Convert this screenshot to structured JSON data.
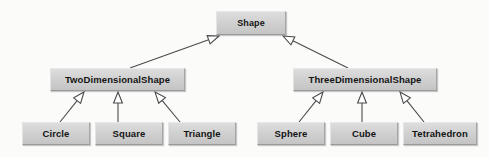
{
  "diagram": {
    "type": "uml-class-inheritance-hierarchy",
    "colors": {
      "background": "#fbfbfa",
      "node_fill": "#d2d2d2",
      "node_border_light": "#e9e9e9",
      "node_border_dark": "#9a9a9a",
      "text": "#141414",
      "edge": "#4a4a4a"
    },
    "nodes": [
      {
        "id": "shape",
        "label": "Shape",
        "tier": "root",
        "x": 216,
        "y": 11,
        "w": 70,
        "h": 24
      },
      {
        "id": "twod",
        "label": "TwoDimensionalShape",
        "tier": "mid",
        "x": 50,
        "y": 68,
        "w": 135,
        "h": 23
      },
      {
        "id": "threed",
        "label": "ThreeDimensionalShape",
        "tier": "mid",
        "x": 293,
        "y": 68,
        "w": 144,
        "h": 23
      },
      {
        "id": "circle",
        "label": "Circle",
        "tier": "leaf",
        "x": 22,
        "y": 122,
        "w": 68,
        "h": 23
      },
      {
        "id": "square",
        "label": "Square",
        "tier": "leaf",
        "x": 95,
        "y": 122,
        "w": 68,
        "h": 23
      },
      {
        "id": "triangle",
        "label": "Triangle",
        "tier": "leaf",
        "x": 168,
        "y": 122,
        "w": 68,
        "h": 23
      },
      {
        "id": "sphere",
        "label": "Sphere",
        "tier": "leaf",
        "x": 257,
        "y": 122,
        "w": 68,
        "h": 23
      },
      {
        "id": "cube",
        "label": "Cube",
        "tier": "leaf",
        "x": 330,
        "y": 122,
        "w": 68,
        "h": 23
      },
      {
        "id": "tetrahedron",
        "label": "Tetrahedron",
        "tier": "leaf",
        "x": 403,
        "y": 122,
        "w": 74,
        "h": 23
      }
    ],
    "edges": [
      {
        "from": "twod",
        "to": "shape",
        "kind": "generalization",
        "x1": 130,
        "y1": 68,
        "x2": 219,
        "y2": 36
      },
      {
        "from": "threed",
        "to": "shape",
        "kind": "generalization",
        "x1": 348,
        "y1": 68,
        "x2": 283,
        "y2": 36
      },
      {
        "from": "circle",
        "to": "twod",
        "kind": "generalization",
        "x1": 60,
        "y1": 122,
        "x2": 84,
        "y2": 92
      },
      {
        "from": "square",
        "to": "twod",
        "kind": "generalization",
        "x1": 118,
        "y1": 122,
        "x2": 118,
        "y2": 92
      },
      {
        "from": "triangle",
        "to": "twod",
        "kind": "generalization",
        "x1": 180,
        "y1": 122,
        "x2": 155,
        "y2": 92
      },
      {
        "from": "sphere",
        "to": "threed",
        "kind": "generalization",
        "x1": 299,
        "y1": 122,
        "x2": 323,
        "y2": 92
      },
      {
        "from": "cube",
        "to": "threed",
        "kind": "generalization",
        "x1": 362,
        "y1": 122,
        "x2": 362,
        "y2": 92
      },
      {
        "from": "tetrahedron",
        "to": "threed",
        "kind": "generalization",
        "x1": 424,
        "y1": 122,
        "x2": 400,
        "y2": 92
      }
    ]
  }
}
